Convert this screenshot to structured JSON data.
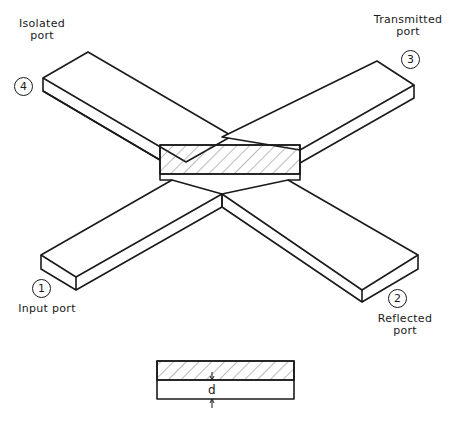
{
  "diagram": {
    "colors": {
      "line": "#1a1a1a",
      "background": "#ffffff"
    },
    "ports": [
      {
        "number": "1",
        "label_line1": "Input port",
        "label_line2": ""
      },
      {
        "number": "2",
        "label_line1": "Reflected",
        "label_line2": "port"
      },
      {
        "number": "3",
        "label_line1": "Transmitted",
        "label_line2": "port"
      },
      {
        "number": "4",
        "label_line1": "Isolated",
        "label_line2": "port"
      }
    ],
    "center_region": "hatched",
    "cross_section": {
      "dimension_label": "d"
    }
  }
}
